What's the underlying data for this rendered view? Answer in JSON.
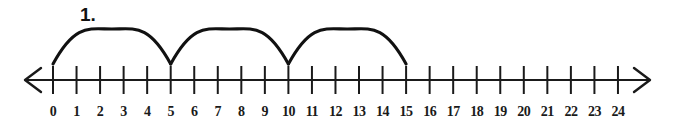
{
  "item": {
    "problem_number": "1.",
    "accent_color": "#111111",
    "background_color": "#ffffff"
  },
  "chart_data": {
    "type": "line",
    "title": "",
    "xlabel": "",
    "ylabel": "",
    "grid": false,
    "legend": null,
    "axis": {
      "min": 0,
      "max": 24,
      "step": 1,
      "left_arrow": true,
      "right_arrow": true,
      "tick_labels": [
        "0",
        "1",
        "2",
        "3",
        "4",
        "5",
        "6",
        "7",
        "8",
        "9",
        "10",
        "11",
        "12",
        "13",
        "14",
        "15",
        "16",
        "17",
        "18",
        "19",
        "20",
        "21",
        "22",
        "23",
        "24"
      ],
      "tick_values": [
        0,
        1,
        2,
        3,
        4,
        5,
        6,
        7,
        8,
        9,
        10,
        11,
        12,
        13,
        14,
        15,
        16,
        17,
        18,
        19,
        20,
        21,
        22,
        23,
        24
      ]
    },
    "jumps": [
      {
        "from": 0,
        "to": 5,
        "size": 5
      },
      {
        "from": 5,
        "to": 10,
        "size": 5
      },
      {
        "from": 10,
        "to": 15,
        "size": 5
      }
    ],
    "annotations": [
      {
        "text": "1.",
        "x": 1.2,
        "position": "above-left"
      }
    ]
  }
}
